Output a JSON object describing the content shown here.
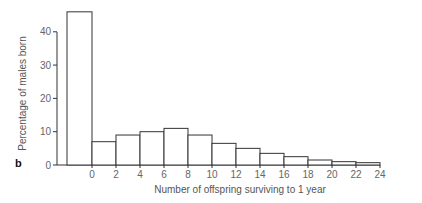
{
  "panel_label": "b",
  "chart_data": {
    "type": "bar",
    "title": "",
    "xlabel": "Number of offspring surviving to 1 year",
    "ylabel": "Percentage of males born",
    "categories": [
      "<0 (none)",
      "0-2",
      "2-4",
      "4-6",
      "6-8",
      "8-10",
      "10-12",
      "12-14",
      "14-16",
      "16-18",
      "18-20",
      "20-22",
      "22-24"
    ],
    "values": [
      46,
      7,
      9,
      10,
      11,
      9,
      6.5,
      5,
      3.5,
      2.5,
      1.5,
      1,
      0.7
    ],
    "x_tick_labels": [
      "0",
      "2",
      "4",
      "6",
      "8",
      "10",
      "12",
      "14",
      "16",
      "18",
      "20",
      "22",
      "24"
    ],
    "y_tick_labels": [
      "0",
      "10",
      "20",
      "30",
      "40"
    ],
    "ylim": [
      0,
      46
    ],
    "grid": false,
    "legend": null
  }
}
